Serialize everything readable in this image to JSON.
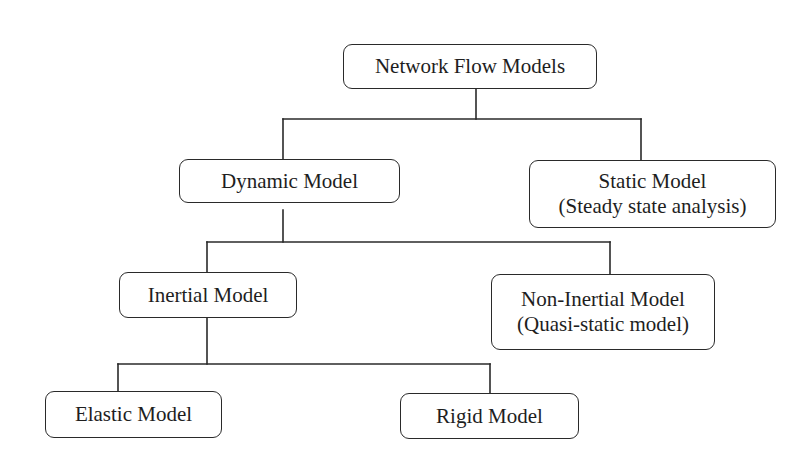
{
  "diagram": {
    "type": "hierarchy-tree",
    "title": "Network Flow Models",
    "nodes": {
      "root": {
        "label": "Network Flow Models"
      },
      "dynamic": {
        "label": "Dynamic Model"
      },
      "static": {
        "label": "Static Model",
        "sublabel": "(Steady state analysis)"
      },
      "inertial": {
        "label": "Inertial Model"
      },
      "non_inertial": {
        "label": "Non-Inertial Model",
        "sublabel": "(Quasi-static model)"
      },
      "elastic": {
        "label": "Elastic Model"
      },
      "rigid": {
        "label": "Rigid Model"
      }
    },
    "edges": [
      {
        "from": "Network Flow Models",
        "to": "Dynamic Model"
      },
      {
        "from": "Network Flow Models",
        "to": "Static Model"
      },
      {
        "from": "Dynamic Model",
        "to": "Inertial Model"
      },
      {
        "from": "Dynamic Model",
        "to": "Non-Inertial Model"
      },
      {
        "from": "Inertial Model",
        "to": "Elastic Model"
      },
      {
        "from": "Inertial Model",
        "to": "Rigid Model"
      }
    ],
    "colors": {
      "stroke": "#2a2a2a",
      "text": "#1e1e1e",
      "background": "#ffffff"
    }
  }
}
